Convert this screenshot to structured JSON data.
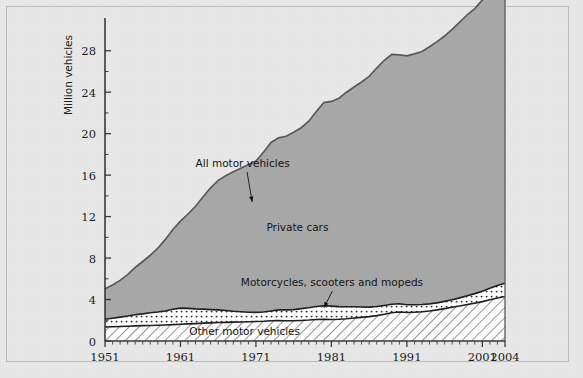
{
  "figure": {
    "background_color": "#e8e8e8",
    "frame_color": "#bdbdbd",
    "axis_color": "#3a3a3a",
    "line_color": "#5a5a5a"
  },
  "chart_data": {
    "type": "area",
    "title": "",
    "subtitle": "",
    "xlabel": "",
    "ylabel": "Million vehicles",
    "xlim": [
      1951,
      2004
    ],
    "ylim": [
      0,
      30
    ],
    "yticks": [
      0,
      4,
      8,
      12,
      16,
      20,
      24,
      28
    ],
    "ytick_labels": [
      "0",
      "4",
      "8",
      "12",
      "16",
      "20",
      "24",
      "28"
    ],
    "xticks": [
      1951,
      1961,
      1971,
      1981,
      1991,
      2001,
      2004
    ],
    "xtick_labels": [
      "1951",
      "1961",
      "1971",
      "1981",
      "1991",
      "2001",
      "2004"
    ],
    "minor_xticks_interval": 1,
    "grid": false,
    "legend_position": "inline-annotations",
    "stacked": true,
    "stack_order_bottom_to_top": [
      "Other motor vehicles",
      "Motorcycles, scooters and mopeds",
      "Private cars"
    ],
    "annotations": [
      {
        "text": "All motor vehicles",
        "kind": "arrow-label",
        "x": 1963,
        "y": 16.8,
        "points_to_x": 1970.5,
        "points_to_y": 13.4
      },
      {
        "text": "Private cars",
        "kind": "region-label",
        "x": 1976.5,
        "y": 10.6
      },
      {
        "text": "Motorcycles, scooters and mopeds",
        "kind": "arrow-label",
        "x": 1969,
        "y": 5.3,
        "points_to_x": 1980.0,
        "points_to_y": 3.2
      },
      {
        "text": "Other motor vehicles",
        "kind": "region-label",
        "x": 1969.5,
        "y": 0.55
      }
    ],
    "fills": {
      "private_cars": {
        "color": "#a8a8a8",
        "pattern": "solid"
      },
      "motorcycles": {
        "color": "#ffffff",
        "pattern": "dots"
      },
      "other": {
        "color": "#ffffff",
        "pattern": "diagonal-hatch"
      }
    },
    "x": [
      1951,
      1952,
      1953,
      1954,
      1955,
      1956,
      1957,
      1958,
      1959,
      1960,
      1961,
      1962,
      1963,
      1964,
      1965,
      1966,
      1967,
      1968,
      1969,
      1970,
      1971,
      1972,
      1973,
      1974,
      1975,
      1976,
      1977,
      1978,
      1979,
      1980,
      1981,
      1982,
      1983,
      1984,
      1985,
      1986,
      1987,
      1988,
      1989,
      1990,
      1991,
      1992,
      1993,
      1994,
      1995,
      1996,
      1997,
      1998,
      1999,
      2000,
      2001,
      2002,
      2003,
      2004
    ],
    "series": [
      {
        "name": "Other motor vehicles",
        "values": [
          1.35,
          1.38,
          1.4,
          1.43,
          1.46,
          1.48,
          1.5,
          1.52,
          1.55,
          1.58,
          1.62,
          1.65,
          1.68,
          1.72,
          1.75,
          1.78,
          1.8,
          1.82,
          1.84,
          1.86,
          1.88,
          1.9,
          1.95,
          1.98,
          1.95,
          1.95,
          1.98,
          2.02,
          2.08,
          2.1,
          2.08,
          2.1,
          2.15,
          2.22,
          2.28,
          2.35,
          2.45,
          2.58,
          2.72,
          2.8,
          2.75,
          2.78,
          2.82,
          2.9,
          3.0,
          3.12,
          3.25,
          3.38,
          3.52,
          3.65,
          3.8,
          3.98,
          4.15,
          4.3
        ]
      },
      {
        "name": "Motorcycles, scooters and mopeds",
        "values": [
          0.75,
          0.82,
          0.9,
          0.98,
          1.08,
          1.14,
          1.22,
          1.28,
          1.35,
          1.48,
          1.55,
          1.5,
          1.42,
          1.35,
          1.28,
          1.22,
          1.14,
          1.05,
          0.98,
          0.92,
          0.88,
          0.9,
          0.95,
          1.02,
          1.05,
          1.08,
          1.14,
          1.18,
          1.25,
          1.3,
          1.28,
          1.22,
          1.15,
          1.08,
          1.0,
          0.92,
          0.88,
          0.85,
          0.82,
          0.8,
          0.75,
          0.72,
          0.7,
          0.68,
          0.68,
          0.7,
          0.72,
          0.78,
          0.85,
          0.92,
          1.0,
          1.1,
          1.2,
          1.28
        ]
      },
      {
        "name": "Private cars",
        "values": [
          2.95,
          3.2,
          3.55,
          4.0,
          4.55,
          5.05,
          5.55,
          6.15,
          6.9,
          7.7,
          8.4,
          9.1,
          9.9,
          10.85,
          11.75,
          12.5,
          13.0,
          13.45,
          13.85,
          14.25,
          14.6,
          15.4,
          16.25,
          16.6,
          16.75,
          17.1,
          17.45,
          18.0,
          18.8,
          19.6,
          19.75,
          20.1,
          20.7,
          21.2,
          21.7,
          22.25,
          23.0,
          23.65,
          24.1,
          24.0,
          24.0,
          24.2,
          24.4,
          24.8,
          25.2,
          25.6,
          26.1,
          26.6,
          27.1,
          27.5,
          28.1,
          28.6,
          29.0,
          29.4
        ]
      }
    ],
    "totals_label": "All motor vehicles",
    "totals": [
      5.05,
      5.4,
      5.85,
      6.41,
      7.09,
      7.67,
      8.27,
      8.95,
      9.8,
      10.76,
      11.57,
      12.25,
      13.0,
      13.92,
      14.78,
      15.5,
      15.94,
      16.32,
      16.67,
      17.03,
      17.36,
      18.2,
      19.15,
      19.6,
      19.75,
      20.13,
      20.57,
      21.2,
      22.13,
      23.0,
      23.11,
      23.42,
      24.0,
      24.5,
      24.98,
      25.52,
      26.33,
      27.08,
      27.64,
      27.6,
      27.5,
      27.7,
      27.92,
      28.38,
      28.88,
      29.42,
      30.07,
      30.76,
      31.47,
      32.07,
      32.9,
      33.68,
      34.35,
      34.98
    ]
  }
}
